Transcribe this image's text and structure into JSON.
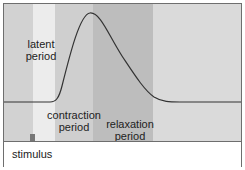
{
  "diagram": {
    "labels": {
      "latent": "latent\nperiod",
      "latent_line1": "latent",
      "latent_line2": "period",
      "contraction_line1": "contraction",
      "contraction_line2": "period",
      "relaxation_line1": "relaxation",
      "relaxation_line2": "period",
      "stimulus": "stimulus"
    },
    "phases": [
      "pre-stimulus",
      "latent period",
      "contraction period",
      "relaxation period",
      "rest"
    ],
    "colors": {
      "curve": "#333333",
      "latent_band": "#ececec",
      "contraction_band": "#cfcfcf",
      "relaxation_band": "#bdbdbd",
      "border": "#6e6e6e"
    }
  }
}
